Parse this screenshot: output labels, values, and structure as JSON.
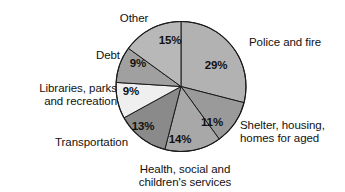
{
  "chart_data": {
    "type": "pie",
    "title": "",
    "subtitle": "",
    "xlabel": "",
    "ylabel": "",
    "legend_position": "none",
    "grid": false,
    "units": "percent",
    "total": 100,
    "start_angle_deg": 0,
    "direction": "clockwise",
    "categories": [
      "Police and fire",
      "Shelter, housing, homes for aged",
      "Health, social and children's services",
      "Transportation",
      "Libraries, parks and recreation",
      "Debt",
      "Other"
    ],
    "values": [
      29,
      11,
      14,
      13,
      9,
      9,
      15
    ],
    "value_labels": [
      "29%",
      "11%",
      "14%",
      "13%",
      "9%",
      "9%",
      "15%"
    ],
    "colors": [
      "#b2b2b2",
      "#9a9a9a",
      "#a8a8a8",
      "#8a8a8a",
      "#efefef",
      "#a0a0a0",
      "#b8b8b8"
    ],
    "slices": [
      {
        "name": "Police and fire",
        "value": 29,
        "value_label": "29%",
        "color": "#b2b2b2",
        "label_text": "Police and fire",
        "label_lines": [
          "Police and fire"
        ]
      },
      {
        "name": "Shelter, housing, homes for aged",
        "value": 11,
        "value_label": "11%",
        "color": "#9a9a9a",
        "label_text": "Shelter, housing, homes for aged",
        "label_lines": [
          "Shelter, housing,",
          "homes for aged"
        ]
      },
      {
        "name": "Health, social and children's services",
        "value": 14,
        "value_label": "14%",
        "color": "#a8a8a8",
        "label_text": "Health, social and children's services",
        "label_lines": [
          "Health, social and",
          "children's services"
        ]
      },
      {
        "name": "Transportation",
        "value": 13,
        "value_label": "13%",
        "color": "#8a8a8a",
        "label_text": "Transportation",
        "label_lines": [
          "Transportation"
        ]
      },
      {
        "name": "Libraries, parks and recreation",
        "value": 9,
        "value_label": "9%",
        "color": "#efefef",
        "label_text": "Libraries, parks and recreation",
        "label_lines": [
          "Libraries, parks",
          "and recreation"
        ]
      },
      {
        "name": "Debt",
        "value": 9,
        "value_label": "9%",
        "color": "#a0a0a0",
        "label_text": "Debt",
        "label_lines": [
          "Debt"
        ]
      },
      {
        "name": "Other",
        "value": 15,
        "value_label": "15%",
        "color": "#b8b8b8",
        "label_text": "Other",
        "label_lines": [
          "Other"
        ]
      }
    ]
  },
  "labels": {
    "police_and_fire": "Police and fire",
    "shelter_line1": "Shelter, housing,",
    "shelter_line2": "homes for aged",
    "health_line1": "Health, social and",
    "health_line2": "children's services",
    "transportation": "Transportation",
    "libraries_line1": "Libraries, parks",
    "libraries_line2": "and recreation",
    "debt": "Debt",
    "other": "Other"
  },
  "percent_labels": {
    "police_and_fire": "29%",
    "shelter": "11%",
    "health": "14%",
    "transportation": "13%",
    "libraries": "9%",
    "debt": "9%",
    "other": "15%"
  }
}
